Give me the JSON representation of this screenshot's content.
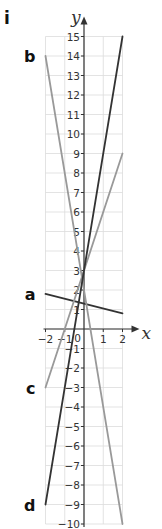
{
  "part_label": "i",
  "chart_data": {
    "type": "line",
    "title": "",
    "xlabel": "x",
    "ylabel": "y",
    "xlim": [
      -2,
      2
    ],
    "ylim": [
      -10,
      15
    ],
    "grid": true,
    "x_ticks": [
      -2,
      -1,
      0,
      1,
      2
    ],
    "x_tick_labels": [
      "−2",
      "−1",
      "0",
      "1",
      "2"
    ],
    "y_ticks": [
      -10,
      -9,
      -8,
      -7,
      -6,
      -5,
      -4,
      -3,
      -2,
      -1,
      1,
      2,
      3,
      4,
      5,
      6,
      7,
      8,
      9,
      10,
      11,
      12,
      13,
      14,
      15
    ],
    "y_tick_labels": [
      "−10",
      "−9",
      "−8",
      "−7",
      "−6",
      "−5",
      "−4",
      "−3",
      "−2",
      "−1",
      "1",
      "2",
      "3",
      "4",
      "5",
      "6",
      "7",
      "8",
      "9",
      "10",
      "11",
      "12",
      "13",
      "14",
      "15"
    ],
    "series": [
      {
        "name": "a",
        "color": "#333333",
        "x": [
          -2,
          2
        ],
        "values": [
          1.8,
          0.8
        ]
      },
      {
        "name": "b",
        "color": "#999999",
        "x": [
          -2,
          2
        ],
        "values": [
          14,
          -10
        ]
      },
      {
        "name": "c",
        "color": "#999999",
        "x": [
          -2,
          2
        ],
        "values": [
          -3,
          9
        ]
      },
      {
        "name": "d",
        "color": "#333333",
        "x": [
          -2,
          2
        ],
        "values": [
          -9,
          15
        ]
      }
    ]
  },
  "labels": {
    "a": "a",
    "b": "b",
    "c": "c",
    "d": "d",
    "x_axis": "x",
    "y_axis": "y"
  }
}
